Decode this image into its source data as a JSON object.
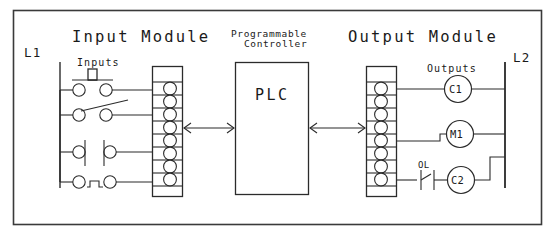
{
  "diagram": {
    "type": "plc-io-wiring-schematic",
    "canvas": {
      "width": 557,
      "height": 238,
      "background": "#ffffff",
      "line_color": "#2b2b2b"
    },
    "frame": {
      "x": 13,
      "y": 10,
      "width": 528,
      "height": 214
    },
    "titles": {
      "input_module": "Input Module",
      "programmable_controller_line1": "Programmable",
      "programmable_controller_line2": "Controller",
      "output_module": "Output Module"
    },
    "labels": {
      "left_rail": "L1",
      "right_rail": "L2",
      "inputs": "Inputs",
      "outputs": "Outputs",
      "plc": "PLC",
      "overload": "OL"
    },
    "input_module": {
      "terminal_count": 8,
      "strip": {
        "x": 152,
        "y": 66,
        "width": 30,
        "height": 130
      },
      "wired_terminals": [
        1,
        3,
        6,
        8
      ],
      "devices": [
        {
          "index": 1,
          "name": "pushbutton-normally-open",
          "symbol": "NO pushbutton",
          "terminal": 1
        },
        {
          "index": 2,
          "name": "limit-switch-normally-open",
          "symbol": "NO limit switch",
          "terminal": 3
        },
        {
          "index": 3,
          "name": "contact-normally-closed",
          "symbol": "NC contact",
          "terminal": 6
        },
        {
          "index": 4,
          "name": "pushbutton-normally-closed",
          "symbol": "NC pushbutton",
          "terminal": 8
        }
      ]
    },
    "controller": {
      "box": {
        "x": 235,
        "y": 62,
        "width": 73,
        "height": 132
      },
      "left_arrow": {
        "label": "bidirectional-data-link",
        "y": 128
      },
      "right_arrow": {
        "label": "bidirectional-data-link",
        "y": 128
      }
    },
    "output_module": {
      "terminal_count": 8,
      "strip": {
        "x": 366,
        "y": 66,
        "width": 30,
        "height": 130
      },
      "wired_terminals": [
        1,
        5,
        8
      ],
      "devices": [
        {
          "index": 1,
          "name": "coil-c1",
          "label": "C1",
          "terminal": 1,
          "series_elements": []
        },
        {
          "index": 2,
          "name": "coil-m1",
          "label": "M1",
          "terminal": 5,
          "series_elements": []
        },
        {
          "index": 3,
          "name": "coil-c2",
          "label": "C2",
          "terminal": 8,
          "series_elements": [
            "OL"
          ]
        }
      ]
    }
  }
}
